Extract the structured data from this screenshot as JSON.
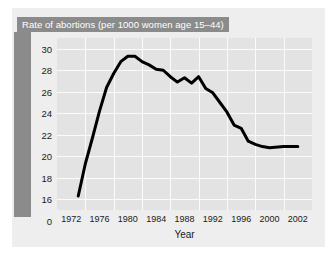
{
  "chart_data": {
    "type": "line",
    "title": "Rate of abortions (per 1000 women age 15–44)",
    "xlabel": "Year",
    "ylabel": "",
    "xlim": [
      1972,
      2003
    ],
    "ylim": [
      15,
      31
    ],
    "yticks": [
      0,
      16,
      18,
      20,
      22,
      24,
      26,
      28,
      30
    ],
    "ytick_labels": [
      "0",
      "16",
      "18",
      "20",
      "22",
      "24",
      "26",
      "28",
      "30"
    ],
    "y_axis_break": true,
    "xticks": [
      1972,
      1976,
      1980,
      1984,
      1988,
      1992,
      1996,
      2000,
      2002
    ],
    "xtick_labels": [
      "1972",
      "1976",
      "1980",
      "1984",
      "1988",
      "1992",
      "1996",
      "2000",
      "2002"
    ],
    "grid": true,
    "legend": "none",
    "line_color": "#000000",
    "line_width": 3,
    "plot_background": "#e3e3e3",
    "figure_background": "#eeeeee",
    "accent_band_color": "#8b8b8b",
    "x": [
      1973,
      1974,
      1975,
      1976,
      1977,
      1978,
      1979,
      1980,
      1981,
      1982,
      1983,
      1984,
      1985,
      1986,
      1987,
      1988,
      1989,
      1990,
      1991,
      1992,
      1993,
      1994,
      1995,
      1996,
      1997,
      1998,
      1999,
      2000,
      2001,
      2002
    ],
    "values": [
      16.3,
      19.3,
      21.7,
      24.2,
      26.4,
      27.7,
      28.8,
      29.3,
      29.3,
      28.8,
      28.5,
      28.1,
      28.0,
      27.4,
      26.9,
      27.3,
      26.8,
      27.4,
      26.3,
      25.9,
      25.0,
      24.1,
      22.9,
      22.6,
      21.4,
      21.1,
      20.9,
      20.8,
      20.9,
      20.9
    ],
    "annotations": []
  }
}
